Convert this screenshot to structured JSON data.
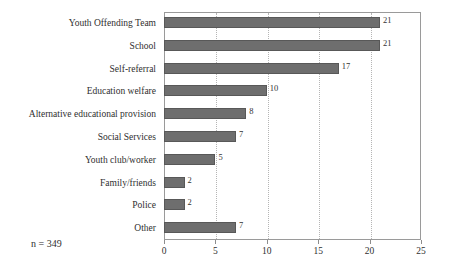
{
  "chart_data": {
    "type": "bar",
    "orientation": "horizontal",
    "title": "",
    "subtitle": "",
    "xlabel": "",
    "ylabel": "",
    "categories": [
      "Youth Offending Team",
      "School",
      "Self-referral",
      "Education welfare",
      "Alternative educational provision",
      "Social Services",
      "Youth club/worker",
      "Family/friends",
      "Police",
      "Other"
    ],
    "values": [
      21,
      21,
      17,
      10,
      8,
      7,
      5,
      2,
      2,
      7
    ],
    "value_labels": [
      "21",
      "21",
      "17",
      "10",
      "8",
      "7",
      "5",
      "2",
      "2",
      "7"
    ],
    "xlim": [
      0,
      25
    ],
    "xticks": [
      0,
      5,
      10,
      15,
      20,
      25
    ],
    "xtick_labels": [
      "0",
      "5",
      "10",
      "15",
      "20",
      "25"
    ],
    "grid": "vertical-dotted",
    "legend": "none",
    "bar_color": "#6e6e6e",
    "bar_edge_color": "#585858",
    "frame_color": "#9a9a9a",
    "gridline_color": "#b5b5b5",
    "background": "#ffffff",
    "annotation": "n = 349"
  },
  "footnote": {
    "text": "n = 349"
  }
}
